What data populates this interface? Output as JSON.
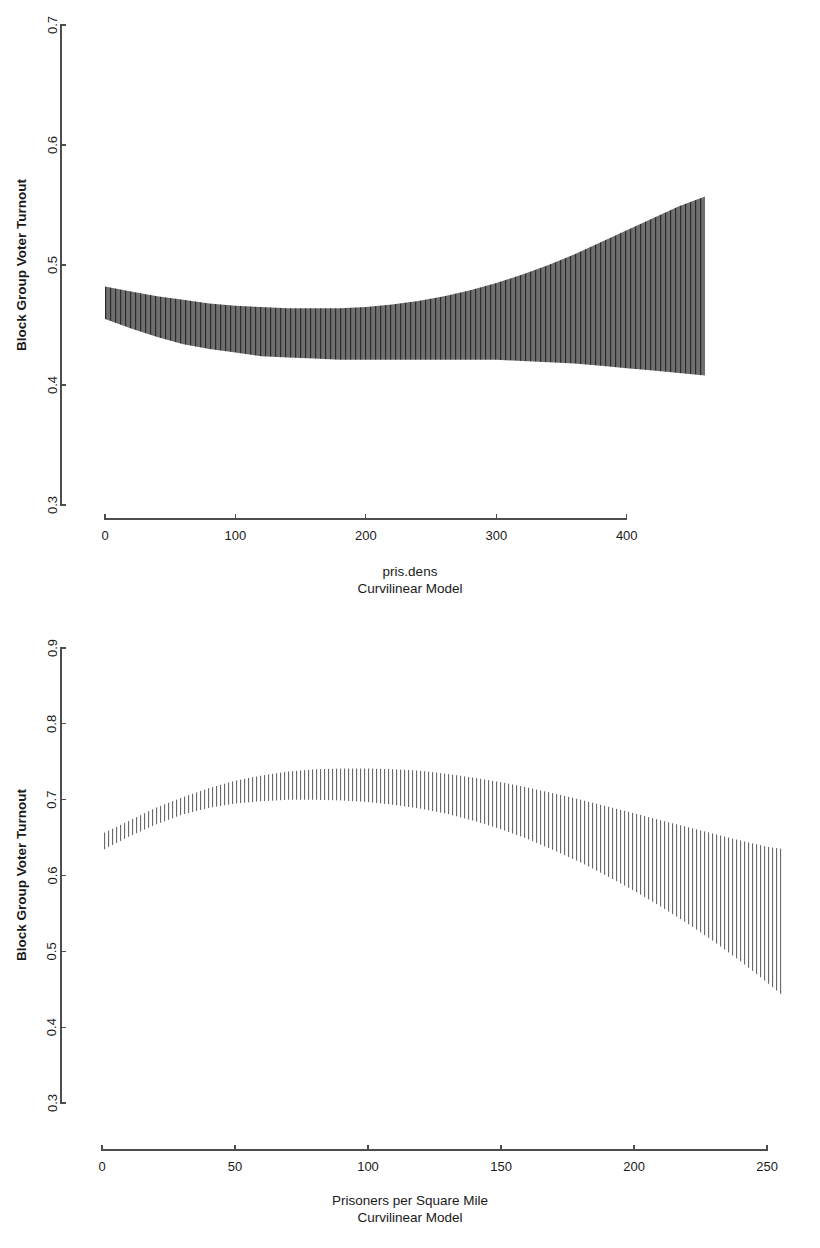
{
  "page": {
    "background": "#ffffff",
    "ink": "#1a1a1a",
    "axis_color": "#4d4d4d"
  },
  "chart_data": [
    {
      "id": "panel-1",
      "type": "area",
      "title": "",
      "xlabel": "pris.dens",
      "sublabel": "Curvilinear Model",
      "ylabel": "Block Group Voter Turnout",
      "xlim": [
        0,
        460
      ],
      "ylim": [
        0.3,
        0.7
      ],
      "xticks": [
        0,
        100,
        200,
        300,
        400
      ],
      "xtick_labels": [
        "0",
        "100",
        "200",
        "300",
        "400"
      ],
      "yticks": [
        0.3,
        0.4,
        0.5,
        0.6,
        0.7
      ],
      "ytick_labels": [
        "0.3",
        "0.4",
        "0.5",
        "0.6",
        "0.7"
      ],
      "grid": false,
      "legend": "none",
      "band_fill": "#6b6b6b",
      "band_hatch_color": "#2f2f2f",
      "band_hatch_spacing": 5,
      "band_label": "confidence band",
      "x": [
        0,
        20,
        40,
        60,
        80,
        100,
        120,
        140,
        160,
        180,
        200,
        220,
        240,
        260,
        280,
        300,
        320,
        340,
        360,
        380,
        400,
        420,
        440,
        460
      ],
      "upper": [
        0.482,
        0.478,
        0.474,
        0.471,
        0.468,
        0.466,
        0.465,
        0.464,
        0.464,
        0.464,
        0.465,
        0.467,
        0.47,
        0.474,
        0.479,
        0.485,
        0.492,
        0.5,
        0.509,
        0.519,
        0.529,
        0.539,
        0.549,
        0.557
      ],
      "lower": [
        0.455,
        0.447,
        0.44,
        0.434,
        0.43,
        0.427,
        0.424,
        0.423,
        0.422,
        0.421,
        0.421,
        0.421,
        0.421,
        0.421,
        0.421,
        0.421,
        0.42,
        0.419,
        0.418,
        0.416,
        0.414,
        0.412,
        0.41,
        0.408
      ]
    },
    {
      "id": "panel-2",
      "type": "area",
      "title": "",
      "xlabel": "Prisoners per Square Mile",
      "sublabel": "Curvilinear Model",
      "ylabel": "Block Group Voter Turnout",
      "xlim": [
        0,
        256
      ],
      "ylim": [
        0.3,
        0.9
      ],
      "xticks": [
        0,
        50,
        100,
        150,
        200,
        250
      ],
      "xtick_labels": [
        "0",
        "50",
        "100",
        "150",
        "200",
        "250"
      ],
      "yticks": [
        0.3,
        0.4,
        0.5,
        0.6,
        0.7,
        0.8,
        0.9
      ],
      "ytick_labels": [
        "0.3",
        "0.4",
        "0.5",
        "0.6",
        "0.7",
        "0.8",
        "0.9"
      ],
      "grid": false,
      "legend": "none",
      "band_fill": "#b3b3b3",
      "band_hatch_color": "#555555",
      "band_hatch_spacing": 4,
      "band_label": "confidence band",
      "x": [
        0,
        10,
        20,
        30,
        40,
        50,
        60,
        70,
        80,
        90,
        100,
        110,
        120,
        130,
        140,
        150,
        160,
        170,
        180,
        190,
        200,
        210,
        220,
        230,
        240,
        250,
        256
      ],
      "upper": [
        0.655,
        0.672,
        0.689,
        0.703,
        0.715,
        0.725,
        0.732,
        0.737,
        0.74,
        0.741,
        0.741,
        0.74,
        0.738,
        0.734,
        0.729,
        0.723,
        0.716,
        0.708,
        0.7,
        0.691,
        0.682,
        0.673,
        0.664,
        0.655,
        0.646,
        0.638,
        0.635
      ],
      "lower": [
        0.633,
        0.651,
        0.667,
        0.68,
        0.689,
        0.695,
        0.698,
        0.7,
        0.7,
        0.699,
        0.697,
        0.693,
        0.688,
        0.681,
        0.672,
        0.661,
        0.648,
        0.633,
        0.617,
        0.599,
        0.58,
        0.559,
        0.537,
        0.513,
        0.487,
        0.459,
        0.441
      ]
    }
  ]
}
